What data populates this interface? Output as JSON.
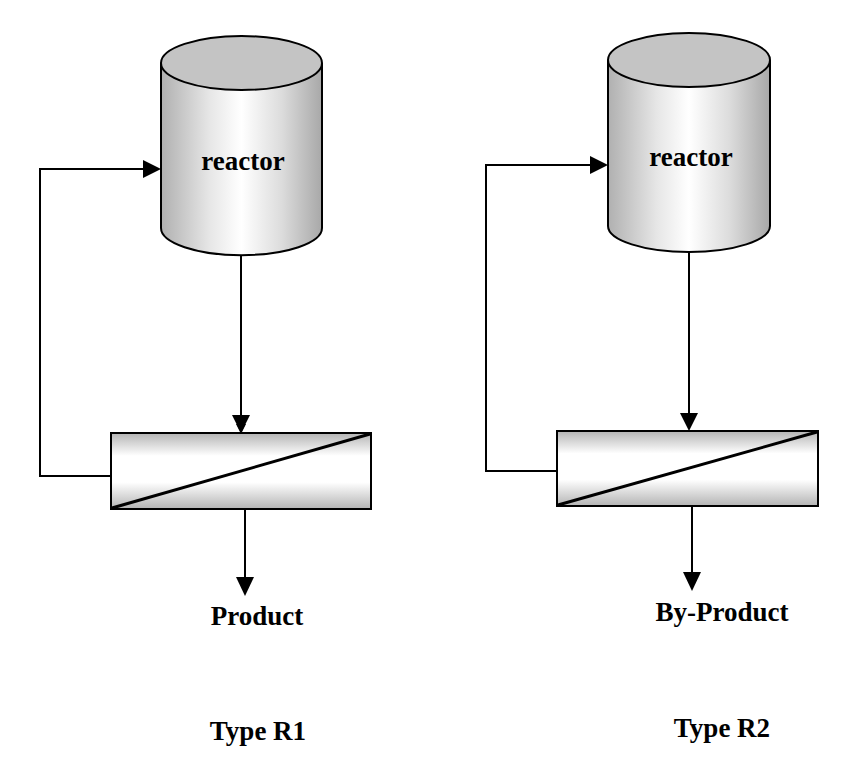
{
  "diagram": {
    "type": "process-flow",
    "colors": {
      "stroke": "#000000",
      "shade_dark": "#b4b4b4",
      "shade_light": "#ffffff",
      "background": "#ffffff"
    },
    "configurations": [
      {
        "id": "R1",
        "reactor_label": "reactor",
        "separator": "membrane-separator",
        "output_label": "Product",
        "recycle": "retentate-to-reactor",
        "type_label": "Type R1"
      },
      {
        "id": "R2",
        "reactor_label": "reactor",
        "separator": "membrane-separator",
        "output_label": "By-Product",
        "recycle": "retentate-to-reactor",
        "type_label": "Type R2"
      }
    ],
    "edges": [
      {
        "config": "R1",
        "from": "reactor",
        "to": "separator"
      },
      {
        "config": "R1",
        "from": "separator",
        "to": "reactor",
        "kind": "recycle"
      },
      {
        "config": "R1",
        "from": "separator",
        "to": "Product"
      },
      {
        "config": "R2",
        "from": "reactor",
        "to": "separator"
      },
      {
        "config": "R2",
        "from": "separator",
        "to": "reactor",
        "kind": "recycle"
      },
      {
        "config": "R2",
        "from": "separator",
        "to": "By-Product"
      }
    ]
  }
}
